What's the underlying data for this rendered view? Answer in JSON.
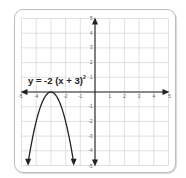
{
  "chart_data": {
    "type": "line",
    "title": "",
    "equation": "y = -2 (x + 3)",
    "equation_exponent": "2",
    "xlabel": "",
    "ylabel": "",
    "xlim": [
      -5,
      5
    ],
    "ylim": [
      -5,
      5
    ],
    "grid": true,
    "x_ticks": [
      -5,
      -4,
      -3,
      -2,
      -1,
      1,
      2,
      3,
      4,
      5
    ],
    "y_ticks": [
      -5,
      -4,
      -3,
      -2,
      -1,
      1,
      2,
      3,
      4,
      5
    ],
    "x_tick_labels": [
      "-5",
      "-4",
      "-2",
      "-1",
      "1",
      "2",
      "3",
      "4",
      "5"
    ],
    "y_tick_labels": [
      "5",
      "4",
      "3",
      "2",
      "1",
      "-1",
      "-2",
      "-3",
      "-4",
      "-5"
    ],
    "series": [
      {
        "name": "y = -2(x+3)^2",
        "vertex": [
          -3,
          0
        ],
        "opens": "down",
        "endpoints_with_arrows": [
          [
            -4.55,
            -4.8
          ],
          [
            -1.45,
            -4.8
          ]
        ],
        "x": [
          -4.55,
          -4.5,
          -4,
          -3.5,
          -3,
          -2.5,
          -2,
          -1.5,
          -1.45
        ],
        "values": [
          -4.8,
          -4.5,
          -2,
          -0.5,
          0,
          -0.5,
          -2,
          -4.5,
          -4.8
        ]
      }
    ],
    "legend": null,
    "colors": {
      "axis": "#222222",
      "grid": "#cccccc",
      "curve": "#222222"
    }
  }
}
